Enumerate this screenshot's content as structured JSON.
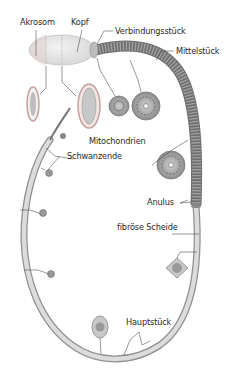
{
  "diagram": {
    "labels": {
      "akrosom": "Akrosom",
      "kopf": "Kopf",
      "verbindungsstueck": "Verbindungsstück",
      "mittelstueck": "Mittelstück",
      "mitochondrien": "Mitochondrien",
      "schwanzende": "Schwanzende",
      "anulus": "Anulus",
      "fibroese_scheide": "fibröse Scheide",
      "hauptstueck": "Hauptstück"
    },
    "colors": {
      "background": "#ffffff",
      "head_fill": "#e6e6e6",
      "head_stroke": "#b8b8b8",
      "midpiece": "#8a8a8a",
      "midpiece_rings": "#6e6e6e",
      "tail_fill": "#d4d4d4",
      "tail_stroke": "#909090",
      "acrosome_rim": "#c98f8a",
      "leader_line": "#555555",
      "text": "#2a2a2a"
    }
  }
}
